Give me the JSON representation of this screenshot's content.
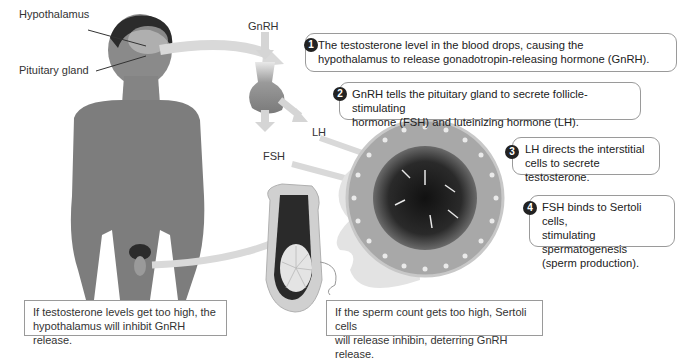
{
  "labels": {
    "hypothalamus": "Hypothalamus",
    "pituitary_gland": "Pituitary gland",
    "gnrh": "GnRH",
    "lh": "LH",
    "fsh": "FSH"
  },
  "steps": [
    {
      "number": "1",
      "lines": [
        "The testosterone level in the blood drops, causing the",
        "hypothalamus to release gonadotropin-releasing hormone (GnRH)."
      ]
    },
    {
      "number": "2",
      "lines": [
        "GnRH tells the pituitary gland to secrete follicle-stimulating",
        "hormone (FSH) and luteinizing hormone (LH)."
      ]
    },
    {
      "number": "3",
      "lines": [
        "LH directs the interstitial",
        "cells to secrete testosterone."
      ]
    },
    {
      "number": "4",
      "lines": [
        "FSH binds to Sertoli cells,",
        "stimulating spermatogenesis",
        "(sperm production)."
      ]
    }
  ],
  "notes": [
    {
      "lines": [
        "If testosterone levels get too high, the",
        "hypothalamus will inhibit GnRH release."
      ]
    },
    {
      "lines": [
        "If the sperm count gets too high, Sertoli cells",
        "will release inhibin, deterring GnRH release."
      ]
    }
  ],
  "colors": {
    "arrow": "#d9d9d9",
    "body": "#7d7d7d",
    "hair": "#2b2b2b",
    "tubule_outer": "#9a9a9a",
    "lumen": "#1c1c1c",
    "badge": "#222222",
    "border": "#9a9a9a"
  }
}
